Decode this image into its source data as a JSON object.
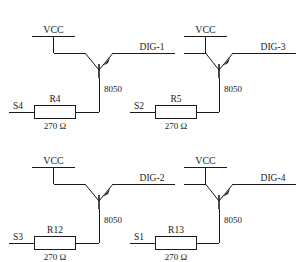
{
  "diagram": {
    "ink_color": "#1a1a1a",
    "background": "#ffffff",
    "width": 302,
    "height": 262
  },
  "stages": [
    {
      "id": "stage-top-left",
      "supply_label": "VCC",
      "transistor_label": "8050",
      "resistor_ref": "R4",
      "resistor_value": "270 Ω",
      "input_label": "S4",
      "output_label": "DIG-1"
    },
    {
      "id": "stage-top-right",
      "supply_label": "VCC",
      "transistor_label": "8050",
      "resistor_ref": "R5",
      "resistor_value": "270 Ω",
      "input_label": "S2",
      "output_label": "DIG-3"
    },
    {
      "id": "stage-bottom-left",
      "supply_label": "VCC",
      "transistor_label": "8050",
      "resistor_ref": "R12",
      "resistor_value": "270 Ω",
      "input_label": "S3",
      "output_label": "DIG-2"
    },
    {
      "id": "stage-bottom-right",
      "supply_label": "VCC",
      "transistor_label": "8050",
      "resistor_ref": "R13",
      "resistor_value": "270 Ω",
      "input_label": "S1",
      "output_label": "DIG-4"
    }
  ]
}
